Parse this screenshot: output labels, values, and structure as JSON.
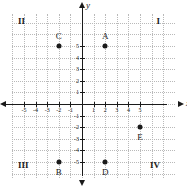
{
  "chart_data": {
    "type": "scatter",
    "title": "",
    "xlabel": "x",
    "ylabel": "y",
    "xlim": [
      -7,
      7
    ],
    "ylim": [
      -7,
      7
    ],
    "grid": true,
    "legend": "none",
    "x_ticks": [
      -5,
      -4,
      -3,
      -2,
      -1,
      1,
      2,
      3,
      4,
      5
    ],
    "y_ticks": [
      5,
      4,
      3,
      2,
      1,
      -1,
      -2,
      -3,
      -4,
      -5
    ],
    "x_tick_labels": [
      "-5",
      "-4",
      "-3",
      "-2",
      "-1",
      "1",
      "2",
      "3",
      "4",
      "5"
    ],
    "y_tick_labels": [
      "5",
      "4",
      "3",
      "2",
      "1",
      "-1",
      "-2",
      "-3",
      "-4",
      "-5"
    ],
    "points": [
      {
        "label": "A",
        "x": 2,
        "y": 5,
        "label_pos": "above"
      },
      {
        "label": "C",
        "x": -2,
        "y": 5,
        "label_pos": "above"
      },
      {
        "label": "B",
        "x": -2,
        "y": -5,
        "label_pos": "below"
      },
      {
        "label": "D",
        "x": 2,
        "y": -5,
        "label_pos": "below"
      },
      {
        "label": "E",
        "x": 5,
        "y": -2,
        "label_pos": "below"
      }
    ],
    "quadrants": [
      {
        "label": "I",
        "corner": "top-right"
      },
      {
        "label": "II",
        "corner": "top-left"
      },
      {
        "label": "III",
        "corner": "bottom-left"
      },
      {
        "label": "IV",
        "corner": "bottom-right"
      }
    ],
    "colors": {
      "axis": "#1a1a1a",
      "grid": "#b9b9b9",
      "point": "#1a1a1a",
      "background": "#ffffff"
    }
  }
}
